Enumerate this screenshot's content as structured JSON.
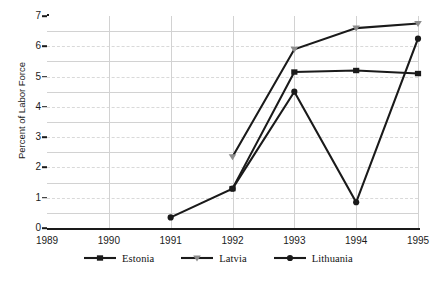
{
  "chart_data": {
    "type": "line",
    "title": "",
    "subtitle": "",
    "xlabel": "",
    "ylabel": "Percent of Labor Force",
    "categories": [
      "1989",
      "1990",
      "1991",
      "1992",
      "1993",
      "1994",
      "1995"
    ],
    "x": [
      1989,
      1990,
      1991,
      1992,
      1993,
      1994,
      1995
    ],
    "ylim": [
      0,
      7
    ],
    "xlim": [
      "1989",
      "1995"
    ],
    "ytick_labels": [
      "0",
      "1",
      "2",
      "3",
      "4",
      "5",
      "6",
      "7"
    ],
    "ytick_values": [
      0,
      1,
      2,
      3,
      4,
      5,
      6,
      7
    ],
    "ytick_step": 1,
    "grid": {
      "horizontal_solid_at": [
        0.5,
        1.5,
        2.5,
        3.5,
        4.5,
        5.5,
        6.5
      ],
      "horizontal_dashed_at": [
        1,
        2,
        3,
        4,
        5,
        6
      ],
      "vertical_solid_at": [
        "1989",
        "1990",
        "1991",
        "1992",
        "1993",
        "1994",
        "1995"
      ],
      "enabled": true
    },
    "legend_position": "bottom",
    "series": [
      {
        "name": "Estonia",
        "marker": "square",
        "color": "#1a1a1a",
        "marker_color": "#1a1a1a",
        "values": [
          null,
          null,
          null,
          1.3,
          5.15,
          5.2,
          5.1
        ],
        "points": [
          {
            "x": "1992",
            "y": 1.3
          },
          {
            "x": "1993",
            "y": 5.15
          },
          {
            "x": "1994",
            "y": 5.2
          },
          {
            "x": "1995",
            "y": 5.1
          }
        ]
      },
      {
        "name": "Latvia",
        "marker": "triangle-down",
        "color": "#1a1a1a",
        "marker_color": "#8c8c8c",
        "values": [
          null,
          null,
          null,
          2.35,
          5.9,
          6.6,
          6.75
        ],
        "points": [
          {
            "x": "1992",
            "y": 2.35
          },
          {
            "x": "1993",
            "y": 5.9
          },
          {
            "x": "1994",
            "y": 6.6
          },
          {
            "x": "1995",
            "y": 6.75
          }
        ]
      },
      {
        "name": "Lithuania",
        "marker": "circle",
        "color": "#1a1a1a",
        "marker_color": "#1a1a1a",
        "values": [
          null,
          null,
          0.35,
          1.3,
          4.5,
          0.85,
          6.25
        ],
        "points": [
          {
            "x": "1991",
            "y": 0.35
          },
          {
            "x": "1992",
            "y": 1.3
          },
          {
            "x": "1993",
            "y": 4.5
          },
          {
            "x": "1994",
            "y": 0.85
          },
          {
            "x": "1995",
            "y": 6.25
          }
        ]
      }
    ]
  },
  "legend": {
    "items": [
      {
        "label": "Estonia"
      },
      {
        "label": "Latvia"
      },
      {
        "label": "Lithuania"
      }
    ]
  }
}
